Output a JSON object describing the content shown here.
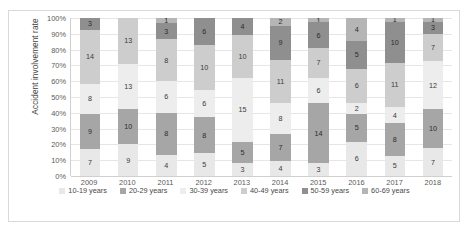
{
  "chart_data": {
    "type": "bar",
    "variant": "stacked-100-percent",
    "title": "",
    "xlabel": "",
    "ylabel": "Accident involvement rate",
    "ylim": [
      0,
      100
    ],
    "ytick_labels": [
      "100%",
      "90%",
      "80%",
      "70%",
      "60%",
      "50%",
      "40%",
      "30%",
      "20%",
      "10%",
      "0%"
    ],
    "grid": true,
    "legend_position": "bottom",
    "categories": [
      "2009",
      "2010",
      "2011",
      "2012",
      "2013",
      "2014",
      "2015",
      "2016",
      "2017",
      "2018"
    ],
    "series": [
      {
        "name": "10-19 years",
        "color": "#e8e8e8",
        "values": [
          7,
          9,
          4,
          5,
          3,
          4,
          3,
          6,
          5,
          7
        ]
      },
      {
        "name": "20-29 years",
        "color": "#a6a6a6",
        "values": [
          9,
          10,
          8,
          8,
          5,
          7,
          14,
          5,
          8,
          10
        ]
      },
      {
        "name": "30-39 years",
        "color": "#ededed",
        "values": [
          8,
          13,
          6,
          6,
          15,
          8,
          6,
          2,
          4,
          12
        ]
      },
      {
        "name": "40-49 years",
        "color": "#cdcdcd",
        "values": [
          14,
          13,
          8,
          10,
          10,
          11,
          7,
          6,
          11,
          7
        ]
      },
      {
        "name": "50-59 years",
        "color": "#8f8f8f",
        "values": [
          3,
          0,
          3,
          6,
          4,
          9,
          6,
          5,
          10,
          3
        ]
      },
      {
        "name": "60-69 years",
        "color": "#b5b5b5",
        "values": [
          0,
          0,
          1,
          0,
          0,
          2,
          1,
          4,
          1,
          1
        ]
      }
    ],
    "column_totals": [
      41,
      45,
      30,
      35,
      37,
      41,
      37,
      28,
      39,
      40
    ]
  },
  "legend": {
    "items": [
      {
        "label": "10-19 years",
        "color": "#e8e8e8"
      },
      {
        "label": "20-29 years",
        "color": "#a6a6a6"
      },
      {
        "label": "30-39 years",
        "color": "#ededed"
      },
      {
        "label": "40-49 years",
        "color": "#cdcdcd"
      },
      {
        "label": "50-59 years",
        "color": "#8f8f8f"
      },
      {
        "label": "60-69 years",
        "color": "#b5b5b5"
      }
    ]
  }
}
